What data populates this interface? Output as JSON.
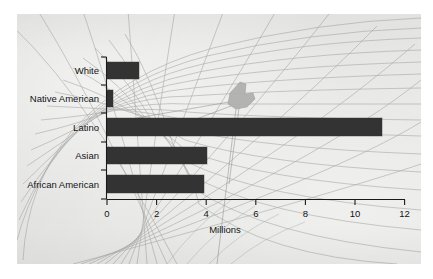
{
  "figure": {
    "background_color": "#ffffff",
    "panel_color": "#e6e6e4",
    "bar_color": "#333333",
    "axis_color": "#1a1a1a",
    "map_line_color": "#9a9a9a",
    "blob_color": "#b0b0ae"
  },
  "chart_data": {
    "type": "bar",
    "orientation": "horizontal",
    "title": "",
    "xlabel": "Millions",
    "ylabel": "",
    "categories": [
      "White",
      "Native American",
      "Latino",
      "Asian",
      "African American"
    ],
    "values": [
      1.3,
      0.25,
      11.1,
      4.05,
      3.9
    ],
    "xlim": [
      0,
      12
    ],
    "xticks": [
      0,
      2,
      4,
      6,
      8,
      10,
      12
    ],
    "xticklabels": [
      "0",
      "2",
      "4",
      "6",
      "8",
      "10",
      "12"
    ],
    "grid": false,
    "legend": null,
    "series": [
      {
        "name": "Population",
        "values": [
          1.3,
          0.25,
          11.1,
          4.05,
          3.9
        ]
      }
    ],
    "annotations": [
      {
        "name": "map-marker-blob",
        "text": "",
        "description": "shaded gray region with radiating boundary lines over background map"
      }
    ],
    "background": "curved map graticule / projection grid"
  },
  "axis": {
    "x_tick_labels": [
      "0",
      "2",
      "4",
      "6",
      "8",
      "10",
      "12"
    ],
    "x_axis_title": "Millions"
  },
  "bars": [
    {
      "label": "White",
      "value": 1.3
    },
    {
      "label": "Native American",
      "value": 0.25
    },
    {
      "label": "Latino",
      "value": 11.1
    },
    {
      "label": "Asian",
      "value": 4.05
    },
    {
      "label": "African American",
      "value": 3.9
    }
  ]
}
